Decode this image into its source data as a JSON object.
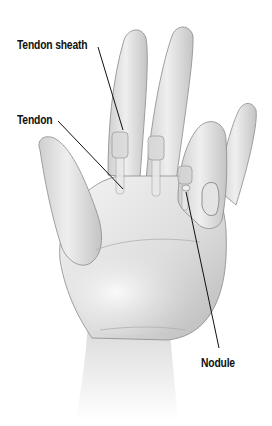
{
  "diagram": {
    "labels": [
      {
        "id": "tendon-sheath",
        "text": "Tendon sheath",
        "x": 17,
        "y": 38,
        "line": [
          [
            98,
            47
          ],
          [
            123,
            130
          ]
        ]
      },
      {
        "id": "tendon",
        "text": "Tendon",
        "x": 17,
        "y": 113,
        "line": [
          [
            58,
            121
          ],
          [
            123,
            189
          ]
        ]
      },
      {
        "id": "nodule",
        "text": "Nodule",
        "x": 201,
        "y": 356,
        "line": [
          [
            186,
            192
          ],
          [
            219,
            348
          ]
        ]
      }
    ],
    "colors": {
      "background": "#ffffff",
      "skin_light": "#f2f2f2",
      "skin_mid": "#d6d6d6",
      "skin_shadow": "#9e9e9e",
      "outline": "#7a7a7a",
      "label_text": "#111111",
      "leader_line": "#111111"
    }
  }
}
